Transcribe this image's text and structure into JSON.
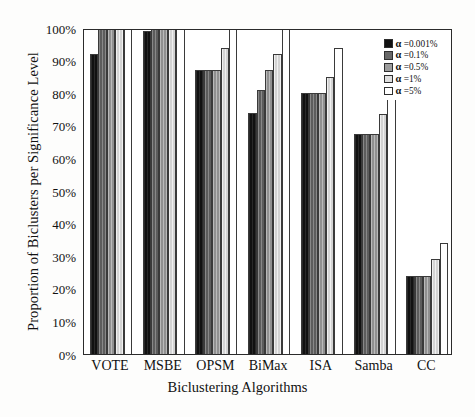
{
  "chart_data": {
    "type": "bar",
    "title": "",
    "xlabel": "Biclustering Algorithms",
    "ylabel": "Proportion of Biclusters per Significance Level",
    "categories": [
      "VOTE",
      "MSBE",
      "OPSM",
      "BiMax",
      "ISA",
      "Samba",
      "CC"
    ],
    "series": [
      {
        "name": "α =0.001%",
        "swatch": "#111111",
        "values": [
          92,
          99,
          87,
          74,
          80,
          67.5,
          24
        ]
      },
      {
        "name": "α =0.1%",
        "swatch": "#676767",
        "values": [
          100,
          100,
          87,
          81,
          80,
          67.5,
          24
        ]
      },
      {
        "name": "α =0.5%",
        "swatch": "#9c9c9c",
        "values": [
          100,
          100,
          87,
          87,
          80,
          67.5,
          24
        ]
      },
      {
        "name": "α =1%",
        "swatch": "#dedede",
        "values": [
          100,
          100,
          94,
          92,
          85,
          73.5,
          29
        ]
      },
      {
        "name": "α =5%",
        "swatch": "#ffffff",
        "values": [
          100,
          100,
          100,
          100,
          94,
          83,
          34
        ]
      }
    ],
    "ylim": [
      0,
      100
    ],
    "ytick_labels": [
      "100%",
      "90%",
      "80%",
      "70%",
      "60%",
      "50%",
      "40%",
      "30%",
      "20%",
      "10%",
      "0%"
    ],
    "ytick_values": [
      100,
      90,
      80,
      70,
      60,
      50,
      40,
      30,
      20,
      10,
      0
    ],
    "grid": false,
    "legend_position": "upper right",
    "frame": true
  }
}
